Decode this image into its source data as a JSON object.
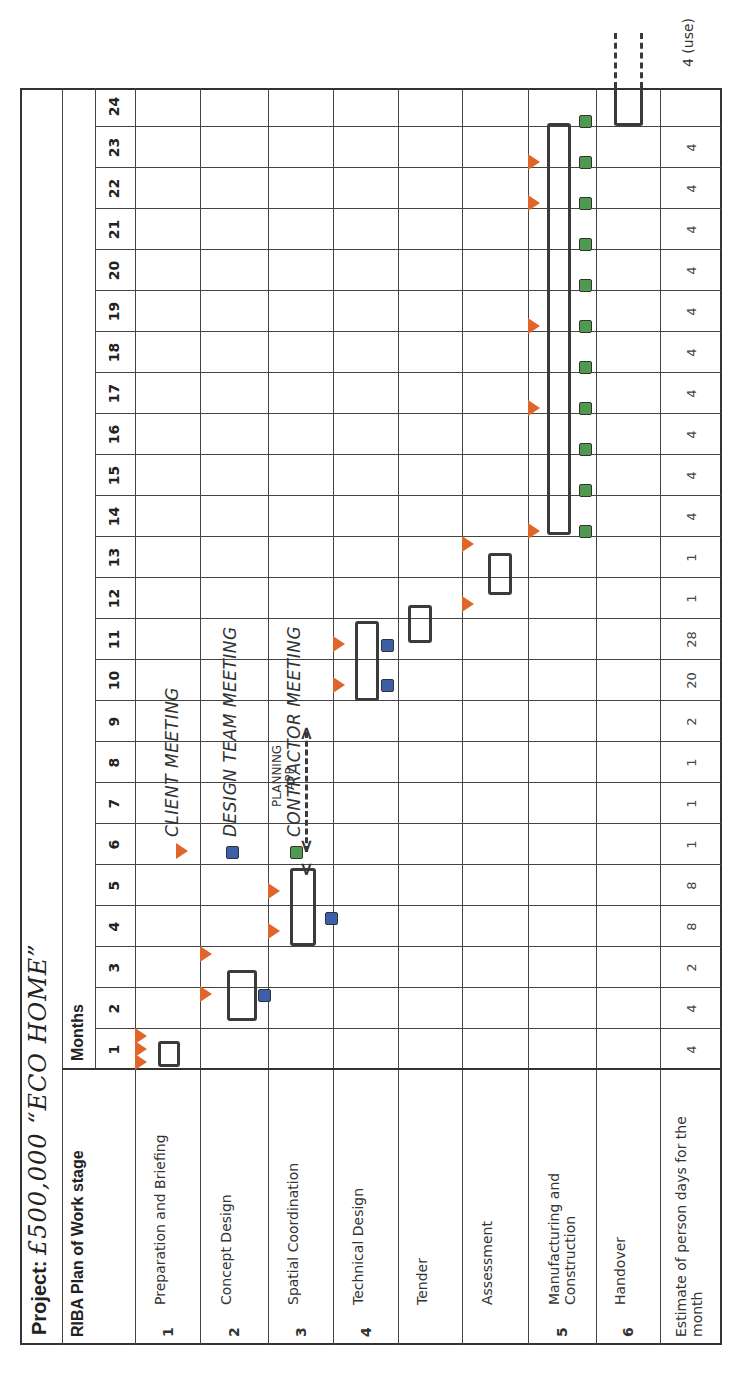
{
  "title": {
    "prefix": "Project: ",
    "name": "£500,000 “ECO HOME”"
  },
  "header": {
    "stage_col": "RIBA Plan of Work stage",
    "months_label": "Months"
  },
  "months": [
    "1",
    "2",
    "3",
    "4",
    "5",
    "6",
    "7",
    "8",
    "9",
    "10",
    "11",
    "12",
    "13",
    "14",
    "15",
    "16",
    "17",
    "18",
    "19",
    "20",
    "21",
    "22",
    "23",
    "24"
  ],
  "stages": [
    {
      "num": "1",
      "label": "Preparation and Briefing"
    },
    {
      "num": "2",
      "label": "Concept Design"
    },
    {
      "num": "3",
      "label": "Spatial Coordination"
    },
    {
      "num": "4",
      "label": "Technical Design"
    },
    {
      "num": "",
      "label": "Tender"
    },
    {
      "num": "",
      "label": "Assessment"
    },
    {
      "num": "5",
      "label": "Manufacturing and Construction"
    },
    {
      "num": "6",
      "label": "Handover"
    }
  ],
  "estimate": {
    "label": "Estimate of person days for the month",
    "values": [
      "4",
      "4",
      "2",
      "8",
      "8",
      "1",
      "1",
      "1",
      "2",
      "20",
      "28",
      "1",
      "1",
      "4",
      "4",
      "4",
      "4",
      "4",
      "4",
      "4",
      "4",
      "4",
      "4",
      ""
    ],
    "note": "4 (use)"
  },
  "legend": {
    "client": "CLIENT MEETING",
    "design": "DESIGN TEAM MEETING",
    "contractor": "CONTRACTOR MEETING"
  },
  "annotation": {
    "line1": "PLANNING",
    "line2": "APP"
  },
  "colors": {
    "client": "#e0652a",
    "design": "#3d5ea8",
    "contractor": "#4f9a4f",
    "bar": "#3a3a3a"
  },
  "chart_data": {
    "type": "table",
    "title": "Project: £500,000 “ECO HOME”",
    "xlabel": "Months",
    "x": [
      1,
      2,
      3,
      4,
      5,
      6,
      7,
      8,
      9,
      10,
      11,
      12,
      13,
      14,
      15,
      16,
      17,
      18,
      19,
      20,
      21,
      22,
      23,
      24
    ],
    "rows": [
      {
        "stage": "1 Preparation and Briefing",
        "bar_months": [
          1,
          1
        ],
        "client_meetings": [
          1,
          1,
          1
        ],
        "design_meetings": []
      },
      {
        "stage": "2 Concept Design",
        "bar_months": [
          2,
          3
        ],
        "client_meetings": [
          2,
          3
        ],
        "design_meetings": [
          2
        ]
      },
      {
        "stage": "3 Spatial Coordination",
        "bar_months": [
          4,
          5
        ],
        "client_meetings": [
          4,
          5
        ],
        "design_meetings": [
          4
        ],
        "annotation": "PLANNING APP months 6-9"
      },
      {
        "stage": "4 Technical Design",
        "bar_months": [
          10,
          11
        ],
        "client_meetings": [
          9,
          11
        ],
        "design_meetings": [
          10,
          11
        ]
      },
      {
        "stage": "Tender",
        "bar_months": [
          11,
          11
        ]
      },
      {
        "stage": "Assessment",
        "bar_months": [
          12,
          13
        ],
        "client_meetings": [
          12,
          13
        ]
      },
      {
        "stage": "5 Manufacturing and Construction",
        "bar_months": [
          14,
          23
        ],
        "client_meetings": [
          14,
          17,
          19,
          22,
          23
        ],
        "contractor_meetings": [
          14,
          15,
          16,
          17,
          18,
          19,
          20,
          21,
          22,
          23,
          24
        ]
      },
      {
        "stage": "6 Handover",
        "bar_months": [
          24,
          24
        ],
        "continues": true
      }
    ],
    "series": [
      {
        "name": "Estimate of person days for the month",
        "values": [
          4,
          4,
          2,
          8,
          8,
          1,
          1,
          1,
          2,
          20,
          28,
          1,
          1,
          4,
          4,
          4,
          4,
          4,
          4,
          4,
          4,
          4,
          4,
          null
        ]
      }
    ],
    "legend": [
      "CLIENT MEETING (orange triangle)",
      "DESIGN TEAM MEETING (blue square)",
      "CONTRACTOR MEETING (green square)"
    ]
  }
}
